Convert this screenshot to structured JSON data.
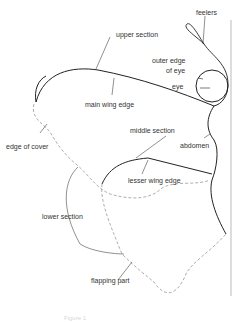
{
  "labels": {
    "feelers": "feelers",
    "upper_section": "upper section",
    "outer_edge_of_eye_1": "outer edge",
    "outer_edge_of_eye_2": "of eye",
    "eye": "eye",
    "main_wing_edge": "main wing edge",
    "middle_section": "middle section",
    "abdomen": "abdomen",
    "edge_of_cover": "edge of cover",
    "lesser_wing_edge": "lesser wing edge",
    "lower_section": "lower section",
    "flapping_part": "flapping part"
  },
  "caption": "Figure 1",
  "colors": {
    "line": "#222222",
    "dashed": "#999999",
    "text": "#333333"
  }
}
